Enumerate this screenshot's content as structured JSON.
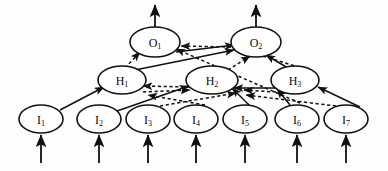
{
  "figure": {
    "kind": "neural-network-diagram",
    "background_color": "#fefefe",
    "ink_color": "#111111",
    "width": 388,
    "height": 171
  },
  "layers": {
    "output": {
      "name": "output-layer",
      "nodes": [
        {
          "id": "O1",
          "label": "O",
          "subscript": "1",
          "cx": 155,
          "cy": 42,
          "rx": 25,
          "ry": 15
        },
        {
          "id": "O2",
          "label": "O",
          "subscript": "2",
          "cx": 256,
          "cy": 42,
          "rx": 25,
          "ry": 15
        }
      ]
    },
    "hidden": {
      "name": "hidden-layer",
      "nodes": [
        {
          "id": "H1",
          "label": "H",
          "subscript": "1",
          "cx": 122,
          "cy": 80,
          "rx": 24,
          "ry": 14
        },
        {
          "id": "H2",
          "label": "H",
          "subscript": "2",
          "cx": 212,
          "cy": 80,
          "rx": 26,
          "ry": 14
        },
        {
          "id": "H3",
          "label": "H",
          "subscript": "3",
          "cx": 295,
          "cy": 80,
          "rx": 24,
          "ry": 14
        }
      ]
    },
    "input": {
      "name": "input-layer",
      "nodes": [
        {
          "id": "I1",
          "label": "I",
          "subscript": "1",
          "cx": 41,
          "cy": 119,
          "rx": 22,
          "ry": 14
        },
        {
          "id": "I2",
          "label": "I",
          "subscript": "2",
          "cx": 99,
          "cy": 119,
          "rx": 22,
          "ry": 14
        },
        {
          "id": "I3",
          "label": "I",
          "subscript": "3",
          "cx": 148,
          "cy": 119,
          "rx": 22,
          "ry": 14
        },
        {
          "id": "I4",
          "label": "I",
          "subscript": "4",
          "cx": 196,
          "cy": 119,
          "rx": 22,
          "ry": 14
        },
        {
          "id": "I5",
          "label": "I",
          "subscript": "5",
          "cx": 245,
          "cy": 119,
          "rx": 22,
          "ry": 14
        },
        {
          "id": "I6",
          "label": "I",
          "subscript": "6",
          "cx": 297,
          "cy": 119,
          "rx": 22,
          "ry": 14
        },
        {
          "id": "I7",
          "label": "I",
          "subscript": "7",
          "cx": 346,
          "cy": 119,
          "rx": 22,
          "ry": 14
        }
      ]
    }
  },
  "external_arrows": {
    "inputs": [
      {
        "name": "input-arrow-1",
        "x": 41,
        "y_from": 163,
        "y_to": 135
      },
      {
        "name": "input-arrow-2",
        "x": 99,
        "y_from": 163,
        "y_to": 135
      },
      {
        "name": "input-arrow-3",
        "x": 148,
        "y_from": 163,
        "y_to": 135
      },
      {
        "name": "input-arrow-4",
        "x": 196,
        "y_from": 163,
        "y_to": 135
      },
      {
        "name": "input-arrow-5",
        "x": 245,
        "y_from": 163,
        "y_to": 135
      },
      {
        "name": "input-arrow-6",
        "x": 297,
        "y_from": 163,
        "y_to": 135
      },
      {
        "name": "input-arrow-7",
        "x": 346,
        "y_from": 163,
        "y_to": 135
      }
    ],
    "outputs": [
      {
        "name": "output-arrow-1",
        "x": 155,
        "y_from": 27,
        "y_to": 5
      },
      {
        "name": "output-arrow-2",
        "x": 256,
        "y_from": 27,
        "y_to": 5
      }
    ]
  },
  "edges": {
    "solid": [
      {
        "name": "edge-I1-H1",
        "from": "I1",
        "to": "H1",
        "x1": 60,
        "y1": 110,
        "x2": 104,
        "y2": 87
      },
      {
        "name": "edge-I2-H2",
        "from": "I2",
        "to": "H2",
        "x1": 117,
        "y1": 111,
        "x2": 189,
        "y2": 86
      },
      {
        "name": "edge-I5-H2",
        "from": "I5",
        "to": "H2",
        "x1": 252,
        "y1": 108,
        "x2": 232,
        "y2": 88
      },
      {
        "name": "edge-I6-H3",
        "from": "I6",
        "to": "H3",
        "x1": 290,
        "y1": 105,
        "x2": 277,
        "y2": 89
      },
      {
        "name": "edge-I7-H3",
        "from": "I7",
        "to": "H3",
        "x1": 360,
        "y1": 107,
        "x2": 318,
        "y2": 87
      },
      {
        "name": "edge-H3-H2",
        "from": "H3",
        "to": "H2",
        "x1": 275,
        "y1": 88,
        "x2": 234,
        "y2": 88
      },
      {
        "name": "edge-H1-O2",
        "from": "H1",
        "to": "O2",
        "x1": 130,
        "y1": 71,
        "x2": 234,
        "y2": 50
      },
      {
        "name": "edge-H3-O2",
        "from": "H3",
        "to": "O2",
        "x1": 288,
        "y1": 68,
        "x2": 266,
        "y2": 55
      },
      {
        "name": "edge-O1-O2",
        "from": "O1",
        "to": "O2",
        "x1": 176,
        "y1": 52,
        "x2": 234,
        "y2": 45
      }
    ],
    "dashed": [
      {
        "name": "edge-H1-O1-dashed",
        "from": "H1",
        "to": "O1",
        "x1": 125,
        "y1": 68,
        "x2": 140,
        "y2": 52
      },
      {
        "name": "edge-O2-O1-dashed",
        "from": "O2",
        "to": "O1",
        "x1": 231,
        "y1": 47,
        "x2": 181,
        "y2": 46
      },
      {
        "name": "edge-H2-O2-dashed",
        "from": "H2",
        "to": "O2",
        "x1": 228,
        "y1": 70,
        "x2": 250,
        "y2": 56
      },
      {
        "name": "edge-H3-O2-dashed",
        "from": "H3",
        "to": "O2",
        "x1": 305,
        "y1": 69,
        "x2": 246,
        "y2": 51
      },
      {
        "name": "edge-H2-H1-dashed",
        "from": "H2",
        "to": "H1",
        "x1": 190,
        "y1": 87,
        "x2": 143,
        "y2": 86
      },
      {
        "name": "edge-H1-H2-dashed",
        "from": "H1",
        "to": "H2",
        "x1": 143,
        "y1": 92,
        "x2": 190,
        "y2": 90
      },
      {
        "name": "edge-H3-H2-dashed",
        "from": "H3",
        "to": "H2",
        "x1": 276,
        "y1": 92,
        "x2": 244,
        "y2": 90
      },
      {
        "name": "edge-I3-H2-dashed",
        "from": "I3",
        "to": "H2",
        "x1": 160,
        "y1": 106,
        "x2": 236,
        "y2": 93
      },
      {
        "name": "edge-I4-H1-dashed",
        "from": "I4",
        "to": "H1",
        "x1": 205,
        "y1": 105,
        "x2": 148,
        "y2": 95
      },
      {
        "name": "edge-I6-O1-dashed",
        "from": "I6",
        "to": "O1",
        "x1": 300,
        "y1": 103,
        "x2": 176,
        "y2": 49
      },
      {
        "name": "edge-I7-H2-dashed",
        "from": "I7",
        "to": "H2",
        "x1": 336,
        "y1": 106,
        "x2": 246,
        "y2": 95
      }
    ]
  }
}
